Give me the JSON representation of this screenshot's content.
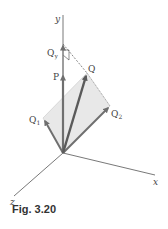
{
  "figure": {
    "caption": "Fig. 3.20",
    "axes": {
      "x": "x",
      "y": "y",
      "z": "z"
    },
    "vectors": [
      {
        "id": "P",
        "label": "P",
        "sub": ""
      },
      {
        "id": "Q",
        "label": "Q",
        "sub": ""
      },
      {
        "id": "Q1",
        "label": "Q",
        "sub": "1"
      },
      {
        "id": "Q2",
        "label": "Q",
        "sub": "2"
      },
      {
        "id": "Qy",
        "label": "Q",
        "sub": "y"
      }
    ],
    "colors": {
      "axis": "#555555",
      "vector": "#6f6f6f",
      "vector_q": "#5a5a5a",
      "plane": "#e6e6e6",
      "dashed": "#555555"
    }
  }
}
